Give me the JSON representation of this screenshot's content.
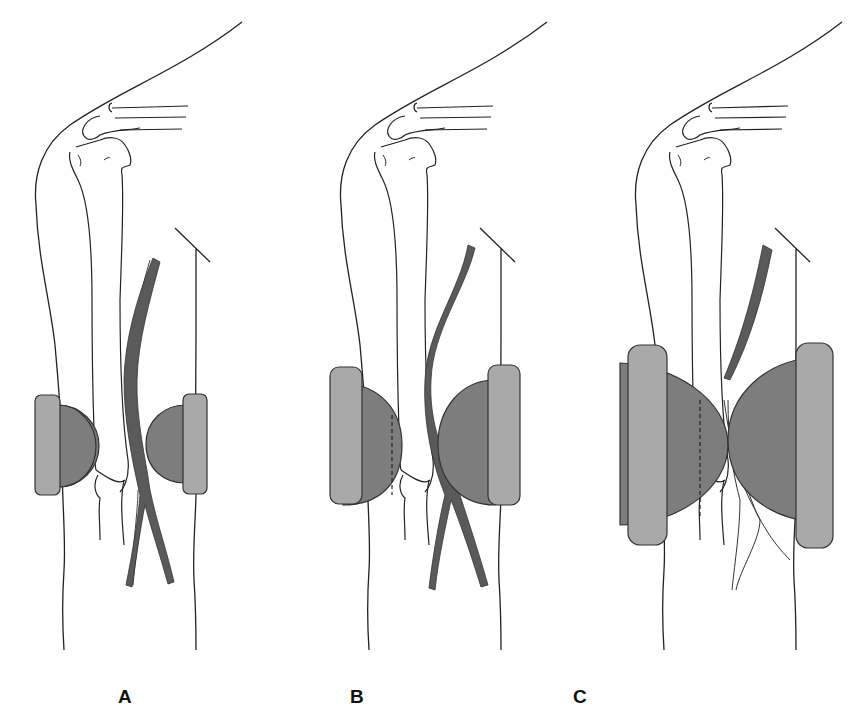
{
  "figure": {
    "colors": {
      "outline": "#222222",
      "vessel": "#5a5a5a",
      "pad_outer": "#a9a9a9",
      "pad_inner": "#7d7d7d",
      "background": "#ffffff"
    },
    "panels": [
      {
        "label": "A",
        "pad_size": "small",
        "vessel_state": "open"
      },
      {
        "label": "B",
        "pad_size": "medium",
        "vessel_state": "displaced"
      },
      {
        "label": "C",
        "pad_size": "large",
        "vessel_state": "compressed"
      }
    ]
  }
}
